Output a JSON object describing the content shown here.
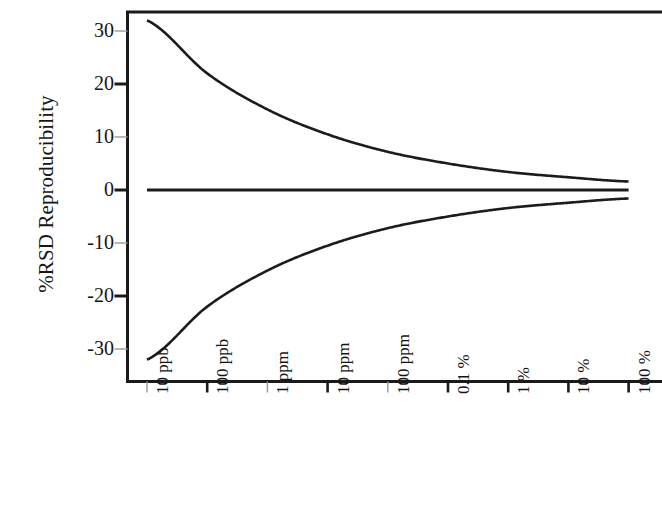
{
  "chart_data": {
    "type": "line",
    "title": "",
    "xlabel": "Concentration of Analyte",
    "ylabel": "%RSD Reproducibility",
    "categories": [
      "10 ppb",
      "100 ppb",
      "1 ppm",
      "10 ppm",
      "100 ppm",
      "0.1 %",
      "1 %",
      "10 %",
      "100 %"
    ],
    "x_tick_labels": [
      "10 ppb",
      "100 ppb",
      "1 ppm",
      "10 ppm",
      "100 ppm",
      "0.1 %",
      "1 %",
      "10 %",
      "100 %"
    ],
    "y_tick_labels": [
      "30",
      "20",
      "10",
      "0",
      "-10",
      "-20",
      "-30"
    ],
    "y_tick_values": [
      30,
      20,
      10,
      0,
      -10,
      -20,
      -30
    ],
    "ylim": [
      -34,
      35
    ],
    "xlim": [
      0,
      9.2
    ],
    "grid": false,
    "legend": null,
    "axis_color": "#1a1a1a",
    "line_color": "#1c1c1c",
    "background": "#ffffff",
    "series": [
      {
        "name": "Upper limit (+%RSD)",
        "x": [
          "10 ppb",
          "100 ppb",
          "1 ppm",
          "10 ppm",
          "100 ppm",
          "0.1 %",
          "1 %",
          "10 %",
          "100 %"
        ],
        "values": [
          32.0,
          22.0,
          15.2,
          10.5,
          7.2,
          5.0,
          3.4,
          2.4,
          1.6
        ]
      },
      {
        "name": "Zero reference",
        "x": [
          "10 ppb",
          "100 ppb",
          "1 ppm",
          "10 ppm",
          "100 ppm",
          "0.1 %",
          "1 %",
          "10 %",
          "100 %"
        ],
        "values": [
          0,
          0,
          0,
          0,
          0,
          0,
          0,
          0,
          0
        ]
      },
      {
        "name": "Lower limit (-%RSD)",
        "x": [
          "10 ppb",
          "100 ppb",
          "1 ppm",
          "10 ppm",
          "100 ppm",
          "0.1 %",
          "1 %",
          "10 %",
          "100 %"
        ],
        "values": [
          -32.0,
          -22.0,
          -15.2,
          -10.5,
          -7.2,
          -5.0,
          -3.4,
          -2.4,
          -1.6
        ]
      }
    ],
    "annotations": []
  },
  "axis_titles": {
    "y": "%RSD Reproducibility",
    "x": "Concentration of Analyte"
  }
}
